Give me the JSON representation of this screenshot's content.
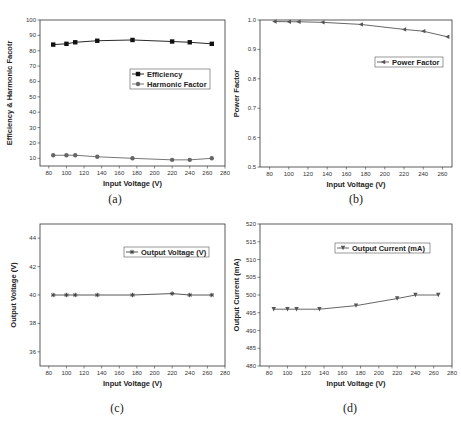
{
  "figure": {
    "panels": [
      "(a)",
      "(b)",
      "(c)",
      "(d)"
    ]
  },
  "chart_data": [
    {
      "id": "a",
      "type": "line",
      "caption": "(a)",
      "xlabel": "Input Voltage (V)",
      "ylabel": "Efficiency & Harmonic Facotr",
      "xlim": [
        70,
        280
      ],
      "ylim": [
        5,
        100
      ],
      "xticks": [
        80,
        100,
        120,
        140,
        160,
        180,
        200,
        220,
        240,
        260,
        280
      ],
      "yticks": [
        10,
        20,
        30,
        40,
        50,
        60,
        70,
        80,
        90,
        100
      ],
      "grid": false,
      "legend_position": "right-middle",
      "x": [
        85,
        100,
        110,
        135,
        175,
        220,
        240,
        265
      ],
      "series": [
        {
          "name": "Efficiency",
          "marker": "square",
          "color": "#111111",
          "values": [
            84,
            84.5,
            85.5,
            86.5,
            87,
            86,
            85.5,
            84.5
          ]
        },
        {
          "name": "Harmonic Factor",
          "marker": "circle",
          "color": "#666666",
          "values": [
            12,
            12,
            12,
            11,
            10,
            9,
            9,
            10
          ]
        }
      ]
    },
    {
      "id": "b",
      "type": "line",
      "caption": "(b)",
      "xlabel": "Input Voltage (V)",
      "ylabel": "Power Factor",
      "xlim": [
        70,
        270
      ],
      "ylim": [
        0.5,
        1.0
      ],
      "xticks": [
        80,
        100,
        120,
        140,
        160,
        180,
        200,
        220,
        240,
        260
      ],
      "yticks": [
        0.5,
        0.6,
        0.7,
        0.8,
        0.9,
        1.0
      ],
      "grid": false,
      "legend_position": "right-upper",
      "x": [
        85,
        100,
        110,
        135,
        175,
        220,
        240,
        265
      ],
      "series": [
        {
          "name": "Power Factor",
          "marker": "triangle-left",
          "color": "#555555",
          "values": [
            0.995,
            0.994,
            0.994,
            0.992,
            0.985,
            0.968,
            0.962,
            0.943
          ]
        }
      ]
    },
    {
      "id": "c",
      "type": "line",
      "caption": "(c)",
      "xlabel": "Input Voltage (V)",
      "ylabel": "Output Voltage (V)",
      "xlim": [
        70,
        280
      ],
      "ylim": [
        35,
        45
      ],
      "xticks": [
        80,
        100,
        120,
        140,
        160,
        180,
        200,
        220,
        240,
        260,
        280
      ],
      "yticks": [
        36,
        38,
        40,
        42,
        44
      ],
      "grid": false,
      "legend_position": "right-upper",
      "x": [
        85,
        100,
        110,
        135,
        175,
        220,
        240,
        265
      ],
      "series": [
        {
          "name": "Output Voltage (V)",
          "marker": "star",
          "color": "#444444",
          "values": [
            40,
            40,
            40,
            40,
            40,
            40.1,
            40,
            40
          ]
        }
      ]
    },
    {
      "id": "d",
      "type": "line",
      "caption": "(d)",
      "xlabel": "Input Voltage (V)",
      "ylabel": "Output Current (mA)",
      "xlim": [
        70,
        280
      ],
      "ylim": [
        480,
        520
      ],
      "xticks": [
        80,
        100,
        120,
        140,
        160,
        180,
        200,
        220,
        240,
        260,
        280
      ],
      "yticks": [
        480,
        485,
        490,
        495,
        500,
        505,
        510,
        515,
        520
      ],
      "grid": false,
      "legend_position": "right-upper",
      "x": [
        85,
        100,
        110,
        135,
        175,
        220,
        240,
        265
      ],
      "series": [
        {
          "name": "Output Current (mA)",
          "marker": "triangle-down",
          "color": "#555555",
          "values": [
            496,
            496,
            496,
            496,
            497,
            499,
            500,
            500
          ]
        }
      ]
    }
  ]
}
